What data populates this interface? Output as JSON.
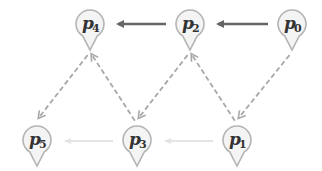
{
  "diagram": {
    "nodes": [
      {
        "id": "p0",
        "label": "p",
        "sub": "0"
      },
      {
        "id": "p1",
        "label": "p",
        "sub": "1"
      },
      {
        "id": "p2",
        "label": "p",
        "sub": "2"
      },
      {
        "id": "p3",
        "label": "p",
        "sub": "3"
      },
      {
        "id": "p4",
        "label": "p",
        "sub": "4"
      },
      {
        "id": "p5",
        "label": "p",
        "sub": "5"
      }
    ],
    "edges": [
      {
        "from": "p0",
        "to": "p2",
        "style": "solid"
      },
      {
        "from": "p2",
        "to": "p4",
        "style": "solid"
      },
      {
        "from": "p1",
        "to": "p3",
        "style": "faint"
      },
      {
        "from": "p3",
        "to": "p5",
        "style": "faint"
      },
      {
        "from": "p0",
        "to": "p1",
        "style": "dashed"
      },
      {
        "from": "p1",
        "to": "p2",
        "style": "dashed"
      },
      {
        "from": "p2",
        "to": "p3",
        "style": "dashed"
      },
      {
        "from": "p3",
        "to": "p4",
        "style": "dashed"
      },
      {
        "from": "p4",
        "to": "p5",
        "style": "dashed"
      }
    ]
  }
}
